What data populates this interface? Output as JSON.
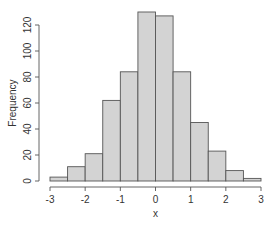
{
  "chart_data": {
    "type": "bar",
    "subtype": "histogram",
    "title": "",
    "xlabel": "x",
    "ylabel": "Frequency",
    "bins": [
      {
        "from": -3.0,
        "to": -2.5,
        "count": 3
      },
      {
        "from": -2.5,
        "to": -2.0,
        "count": 11
      },
      {
        "from": -2.0,
        "to": -1.5,
        "count": 21
      },
      {
        "from": -1.5,
        "to": -1.0,
        "count": 62
      },
      {
        "from": -1.0,
        "to": -0.5,
        "count": 84
      },
      {
        "from": -0.5,
        "to": 0.0,
        "count": 130
      },
      {
        "from": 0.0,
        "to": 0.5,
        "count": 127
      },
      {
        "from": 0.5,
        "to": 1.0,
        "count": 84
      },
      {
        "from": 1.0,
        "to": 1.5,
        "count": 45
      },
      {
        "from": 1.5,
        "to": 2.0,
        "count": 23
      },
      {
        "from": 2.0,
        "to": 2.5,
        "count": 8
      },
      {
        "from": 2.5,
        "to": 3.0,
        "count": 2
      }
    ],
    "categories": [
      "-3 to -2.5",
      "-2.5 to -2",
      "-2 to -1.5",
      "-1.5 to -1",
      "-1 to -0.5",
      "-0.5 to 0",
      "0 to 0.5",
      "0.5 to 1",
      "1 to 1.5",
      "1.5 to 2",
      "2 to 2.5",
      "2.5 to 3"
    ],
    "values": [
      3,
      11,
      21,
      62,
      84,
      130,
      127,
      84,
      45,
      23,
      8,
      2
    ],
    "xlim": [
      -3,
      3
    ],
    "ylim": [
      0,
      130
    ],
    "x_ticks": [
      "-3",
      "-2",
      "-1",
      "0",
      "1",
      "2",
      "3"
    ],
    "y_ticks": [
      "0",
      "20",
      "40",
      "60",
      "80",
      "100",
      "120"
    ],
    "grid": false,
    "legend": null,
    "colors": {
      "bar_fill": "#d3d3d3",
      "bar_stroke": "#555555",
      "axis": "#555555",
      "text": "#333333"
    }
  }
}
